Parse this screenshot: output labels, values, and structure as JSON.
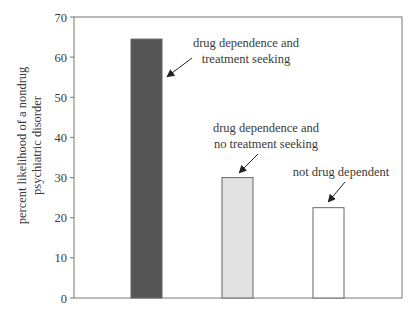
{
  "chart_data": {
    "type": "bar",
    "title": "",
    "xlabel": "",
    "ylabel": "percent likelihood of a nondrug psychiatric disorder",
    "ylabel_lines": [
      "percent likelihood of a nondrug",
      "psychiatric disorder"
    ],
    "ylim": [
      0,
      70
    ],
    "yticks": [
      0,
      10,
      20,
      30,
      40,
      50,
      60,
      70
    ],
    "grid": false,
    "legend": "none (bars labeled by arrow annotations)",
    "categories": [
      "drug dependence and treatment seeking",
      "drug dependence and no treatment seeking",
      "not drug dependent"
    ],
    "values": [
      64.5,
      30,
      22.5
    ],
    "bar_colors": [
      "#555555",
      "#e2e2e2",
      "#ffffff"
    ],
    "annotations": [
      {
        "lines": [
          "drug dependence and",
          "treatment seeking"
        ],
        "points_to": 0
      },
      {
        "lines": [
          "drug dependence and",
          "no treatment seeking"
        ],
        "points_to": 1
      },
      {
        "lines": [
          "not drug dependent"
        ],
        "points_to": 2
      }
    ]
  },
  "style": {
    "axis_color": "#777777",
    "bar_border_color": "#666666",
    "arrow_color": "#222222"
  }
}
